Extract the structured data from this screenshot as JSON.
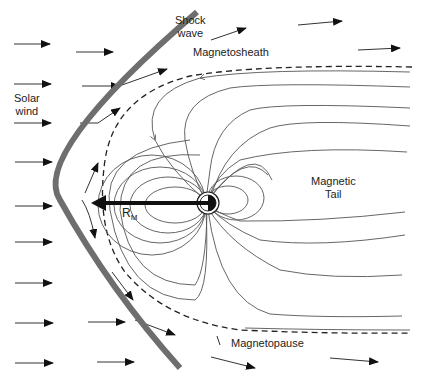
{
  "diagram": {
    "labels": {
      "shock_wave_line1": "Shock",
      "shock_wave_line2": "wave",
      "magnetosheath": "Magnetosheath",
      "solar_wind_line1": "Solar",
      "solar_wind_line2": "wind",
      "magnetic_tail_line1": "Magnetic",
      "magnetic_tail_line2": "Tail",
      "magnetopause": "Magnetopause",
      "rm": "R",
      "rm_sub": "M"
    },
    "colors": {
      "shock_wave": "#6e6e6e",
      "lines": "#555555",
      "arrows": "#111111"
    }
  }
}
